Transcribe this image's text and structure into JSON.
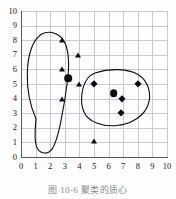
{
  "chart_data": {
    "type": "scatter",
    "title": "",
    "subtitle": "",
    "xlabel": "",
    "ylabel": "",
    "xlim": [
      0,
      10
    ],
    "ylim": [
      0,
      10
    ],
    "xticks": [
      "0",
      "1",
      "2",
      "3",
      "4",
      "5",
      "6",
      "7",
      "8",
      "9",
      "10"
    ],
    "yticks": [
      "0",
      "1",
      "2",
      "3",
      "4",
      "5",
      "6",
      "7",
      "8",
      "9",
      "10"
    ],
    "grid": true,
    "legend": "none",
    "series": [
      {
        "name": "cluster-1-points",
        "marker": "triangle",
        "color": "#0d0d11",
        "points": [
          {
            "x": 2.8,
            "y": 8.0
          },
          {
            "x": 3.9,
            "y": 7.0
          },
          {
            "x": 2.8,
            "y": 6.0
          },
          {
            "x": 4.0,
            "y": 5.0
          },
          {
            "x": 2.8,
            "y": 4.0
          },
          {
            "x": 5.0,
            "y": 1.1
          }
        ]
      },
      {
        "name": "cluster-2-points",
        "marker": "diamond",
        "color": "#0d0d11",
        "points": [
          {
            "x": 5.0,
            "y": 5.0
          },
          {
            "x": 8.0,
            "y": 5.0
          },
          {
            "x": 6.95,
            "y": 4.0
          },
          {
            "x": 6.85,
            "y": 3.0
          }
        ]
      },
      {
        "name": "centroids",
        "marker": "circle",
        "color": "#0d0d11",
        "points": [
          {
            "x": 3.25,
            "y": 5.4
          },
          {
            "x": 6.35,
            "y": 4.35
          }
        ]
      }
    ],
    "annotations": [
      {
        "name": "cluster-1-outline",
        "shape": "closed-curve"
      },
      {
        "name": "cluster-2-outline",
        "shape": "closed-curve"
      }
    ]
  },
  "caption": {
    "text": "图 10-6    聚类的质心"
  }
}
